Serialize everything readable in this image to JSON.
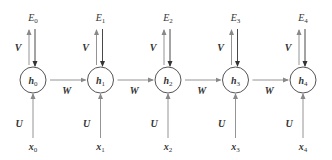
{
  "diagram": {
    "type": "unrolled-recurrent-network",
    "colors": {
      "circle_stroke": "#555555",
      "arrow_up": "#888888",
      "arrow_down": "#333333",
      "arrow_horizontal": "#888888",
      "text": "#333333"
    },
    "weight_labels": {
      "output": "V",
      "input": "U",
      "recurrent": "W"
    },
    "nodes": [
      {
        "hidden": "h",
        "hidden_sub": "0",
        "input": "x",
        "input_sub": "0",
        "output": "E",
        "output_sub": "0"
      },
      {
        "hidden": "h",
        "hidden_sub": "1",
        "input": "x",
        "input_sub": "1",
        "output": "E",
        "output_sub": "1"
      },
      {
        "hidden": "h",
        "hidden_sub": "2",
        "input": "x",
        "input_sub": "2",
        "output": "E",
        "output_sub": "2"
      },
      {
        "hidden": "h",
        "hidden_sub": "3",
        "input": "x",
        "input_sub": "3",
        "output": "E",
        "output_sub": "3"
      },
      {
        "hidden": "h",
        "hidden_sub": "4",
        "input": "x",
        "input_sub": "4",
        "output": "E",
        "output_sub": "4"
      }
    ]
  }
}
